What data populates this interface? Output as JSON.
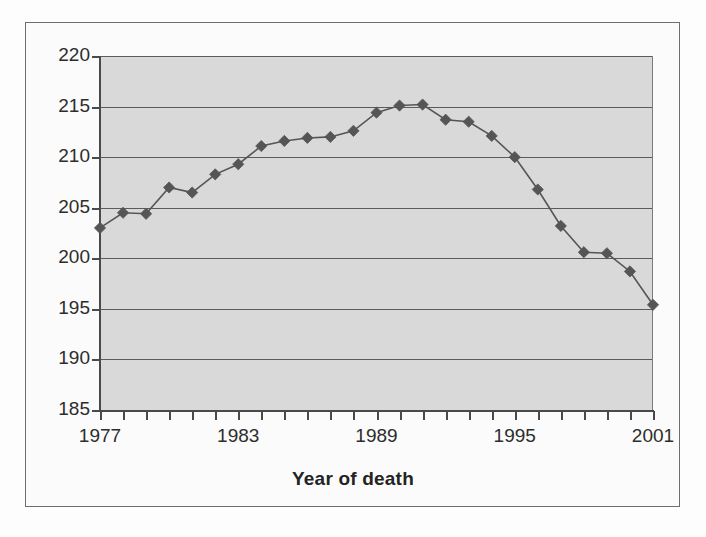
{
  "chart_data": {
    "type": "line",
    "title": "",
    "xlabel": "Year of death",
    "ylabel": "",
    "x": [
      1977,
      1978,
      1979,
      1980,
      1981,
      1982,
      1983,
      1984,
      1985,
      1986,
      1987,
      1988,
      1989,
      1990,
      1991,
      1992,
      1993,
      1994,
      1995,
      1996,
      1997,
      1998,
      1999,
      2000,
      2001
    ],
    "values": [
      203.0,
      204.5,
      204.4,
      207.0,
      206.5,
      208.3,
      209.3,
      211.1,
      211.6,
      211.9,
      212.0,
      212.6,
      214.4,
      215.1,
      215.2,
      213.7,
      213.5,
      212.1,
      210.0,
      206.8,
      203.2,
      200.6,
      200.5,
      198.7,
      195.4
    ],
    "series": [
      {
        "name": "series-1",
        "values": [
          203.0,
          204.5,
          204.4,
          207.0,
          206.5,
          208.3,
          209.3,
          211.1,
          211.6,
          211.9,
          212.0,
          212.6,
          214.4,
          215.1,
          215.2,
          213.7,
          213.5,
          212.1,
          210.0,
          206.8,
          203.2,
          200.6,
          200.5,
          198.7,
          195.4
        ],
        "color": "#555555",
        "marker": "diamond"
      }
    ],
    "ylim": [
      185,
      220
    ],
    "xlim": [
      1977,
      2001
    ],
    "y_ticks": [
      220,
      215,
      210,
      205,
      200,
      195,
      190,
      185
    ],
    "y_tick_labels": [
      "220",
      "215",
      "210",
      "205",
      "200",
      "195",
      "190",
      "185"
    ],
    "x_ticks": [
      1977,
      1983,
      1989,
      1995,
      2001
    ],
    "x_tick_labels": [
      "1977",
      "1983",
      "1989",
      "1995",
      "2001"
    ],
    "x_minor_tick_interval": 1,
    "grid": "horizontal",
    "legend": "none",
    "plot_background": "#d9d9d9",
    "figure_background": "#fbfbfb",
    "gridline_color": "#5b5b5b",
    "axis_color": "#4a4a4a"
  },
  "axes": {
    "x_title": "Year of death"
  }
}
